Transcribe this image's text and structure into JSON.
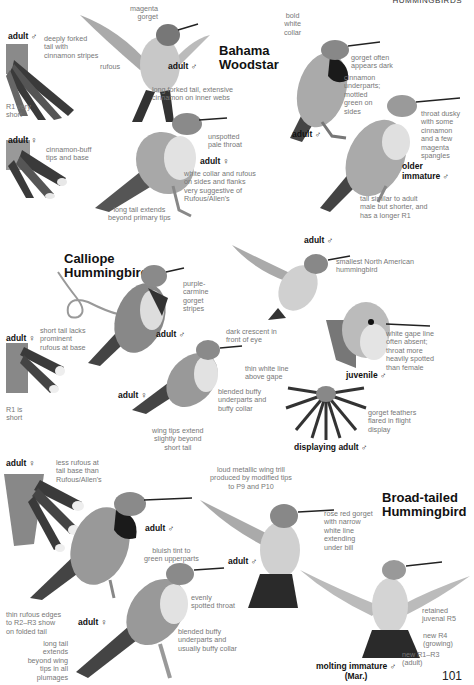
{
  "header": {
    "section": "HUMMINGBIRDS"
  },
  "page_number": "101",
  "species": [
    {
      "name": "Bahama\nWoodstar",
      "figures": [
        {
          "label": "adult ♂",
          "notes": [
            "deeply forked\ntail with\ncinnamon stripes",
            "R1 very\nshort"
          ]
        },
        {
          "label": "adult ♂",
          "notes": [
            "magenta\ngorget",
            "rufous",
            "long forked tail, extensive\ncinnamon on inner webs"
          ]
        },
        {
          "label": "adult ♀",
          "notes": [
            "cinnamon-buff\ntips and base"
          ]
        },
        {
          "label": "adult ♀",
          "notes": [
            "unspotted\npale throat",
            "white collar and rufous\non sides and flanks\nvery suggestive of\nRufous/Allen's",
            "long tail extends\nbeyond primary tips"
          ]
        },
        {
          "label": "adult ♂",
          "notes": [
            "bold\nwhite\ncollar",
            "gorget often\nappears dark",
            "cinnamon\nunderparts;\nmottled\ngreen on\nsides"
          ]
        },
        {
          "label": "older\nimmature ♂",
          "notes": [
            "throat dusky\nwith some\ncinnamon\nand a few\nmagenta\nspangles",
            "tail similar to adult\nmale but shorter, and\nhas a longer R1"
          ]
        }
      ]
    },
    {
      "name": "Calliope\nHummingbird",
      "figures": [
        {
          "label": "adult ♂",
          "notes": [
            "purple-\ncarmine\ngorget\nstripes"
          ]
        },
        {
          "label": "adult ♂",
          "notes": [
            "smallest North American\nhummingbird"
          ]
        },
        {
          "label": "adult ♀",
          "notes": [
            "short tail lacks\nprominent\nrufous at base",
            "R1 is\nshort"
          ]
        },
        {
          "label": "adult ♀",
          "notes": [
            "dark crescent in\nfront of eye",
            "thin white line\nabove gape",
            "blended buffy\nunderparts and\nbuffy collar",
            "wing tips extend\nslightly beyond\nshort tail"
          ]
        },
        {
          "label": "juvenile ♂",
          "notes": [
            "white gape line\noften absent;\nthroat more\nheavily spotted\nthan female"
          ]
        },
        {
          "label": "displaying adult ♂",
          "notes": [
            "gorget feathers\nflared in flight\ndisplay"
          ]
        }
      ]
    },
    {
      "name": "Broad-tailed\nHummingbird",
      "figures": [
        {
          "label": "adult ♀",
          "notes": [
            "less rufous at\ntail base than\nRufous/Allen's"
          ]
        },
        {
          "label": "adult ♂",
          "notes": [
            "bluish tint to\ngreen upperparts",
            "thin rufous edges\nto R2–R3 show\non folded tail"
          ]
        },
        {
          "label": "adult ♂",
          "notes": [
            "loud metallic wing trill\nproduced by modified tips\nto P9 and P10",
            "rose red gorget\nwith narrow\nwhite line\nextending\nunder bill"
          ]
        },
        {
          "label": "adult ♀",
          "notes": [
            "evenly\nspotted throat",
            "blended buffy\nunderparts and\nusually buffy collar",
            "long tail\nextends\nbeyond wing\ntips in all\nplumages"
          ]
        },
        {
          "label": "molting immature ♂\n(Mar.)",
          "notes": [
            "retained\njuvenal R5",
            "new R4\n(growing)",
            "new R1–R3\n(adult)"
          ]
        }
      ]
    }
  ],
  "colors": {
    "ink": "#111111",
    "note": "#777777",
    "bird_dark": "#3a3a3a",
    "bird_mid": "#8a8a8a",
    "bird_light": "#d8d8d8",
    "background": "#ffffff"
  }
}
